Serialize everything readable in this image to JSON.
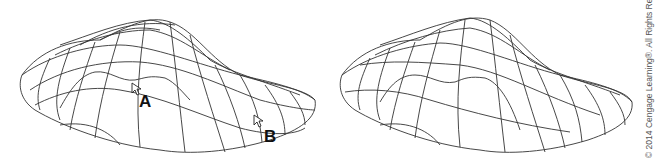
{
  "figure": {
    "panels": [
      {
        "id": "left",
        "annotations": [
          {
            "label": "A"
          },
          {
            "label": "B"
          }
        ]
      },
      {
        "id": "right",
        "annotations": []
      }
    ]
  },
  "labels": {
    "a": "A",
    "b": "B"
  },
  "copyright": "© 2014 Cengage Learning®. All Rights Reserved.",
  "colors": {
    "stroke": "#333333",
    "background": "#ffffff"
  }
}
